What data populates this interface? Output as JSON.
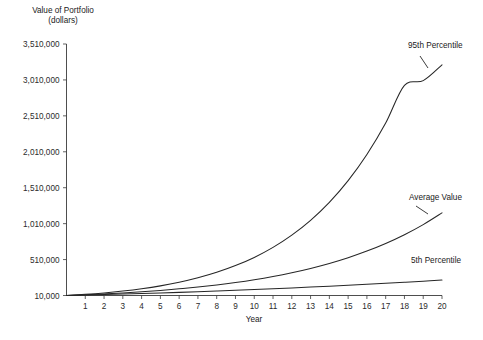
{
  "chart_data": {
    "type": "line",
    "title": "",
    "ylabel": "Value of Portfolio\n(dollars)",
    "ylabel_line1": "Value of Portfolio",
    "ylabel_line2": "(dollars)",
    "xlabel": "Year",
    "x": [
      0,
      1,
      2,
      3,
      4,
      5,
      6,
      7,
      8,
      9,
      10,
      11,
      12,
      13,
      14,
      15,
      16,
      17,
      18,
      19,
      20
    ],
    "xtick_labels": [
      "1",
      "2",
      "3",
      "4",
      "5",
      "6",
      "7",
      "8",
      "9",
      "10",
      "11",
      "12",
      "13",
      "14",
      "15",
      "16",
      "17",
      "18",
      "19",
      "20"
    ],
    "xlim": [
      0,
      20
    ],
    "ylim": [
      10000,
      3510000
    ],
    "ytick_labels": [
      "10,000",
      "510,000",
      "1,010,000",
      "1,510,000",
      "2,010,000",
      "2,510,000",
      "3,010,000",
      "3,510,000"
    ],
    "ytick_values": [
      10000,
      510000,
      1010000,
      1510000,
      2010000,
      2510000,
      3010000,
      3510000
    ],
    "grid": false,
    "legend_position": "inline-annotations",
    "line_color": "#262626",
    "series": [
      {
        "name": "95th Percentile",
        "label_x": 20,
        "values": [
          10000,
          26000,
          46000,
          72000,
          104000,
          144000,
          194000,
          256000,
          332000,
          426000,
          540000,
          680000,
          850000,
          1056000,
          1306000,
          1608000,
          1972000,
          2410000,
          2934000,
          3000000,
          3220000
        ]
      },
      {
        "name": "Average Value",
        "label_x": 20,
        "values": [
          10000,
          20000,
          32000,
          46000,
          62000,
          81000,
          103000,
          128000,
          157000,
          191000,
          230000,
          275000,
          327000,
          387000,
          456000,
          536000,
          628000,
          734000,
          856000,
          997000,
          1160000
        ]
      },
      {
        "name": "5th Percentile",
        "label_x": 20,
        "values": [
          10000,
          16000,
          22500,
          29500,
          37000,
          45000,
          53500,
          62500,
          72000,
          82000,
          92500,
          103500,
          115000,
          127000,
          139500,
          152500,
          166000,
          180000,
          194500,
          209500,
          225000
        ]
      }
    ],
    "annotations": [
      {
        "text": "95th Percentile",
        "x_px": 408,
        "y_px": 48
      },
      {
        "text": "Average Value",
        "x_px": 409,
        "y_px": 200
      },
      {
        "text": "5th Percentile",
        "x_px": 411,
        "y_px": 263
      }
    ]
  }
}
